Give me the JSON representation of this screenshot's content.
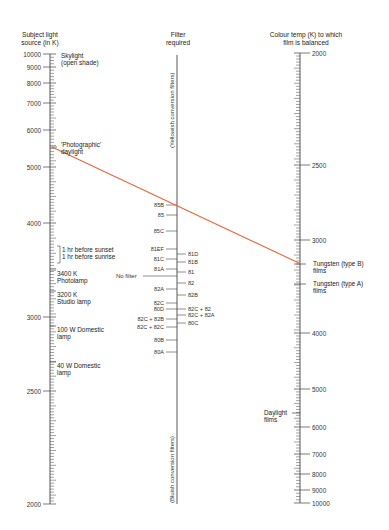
{
  "headers": {
    "left": [
      "Subject light",
      "source (in K)"
    ],
    "middle": [
      "Filter",
      "required"
    ],
    "right": [
      "Colour temp (K) to which",
      "film is balanced"
    ]
  },
  "left_axis": {
    "ticks": [
      {
        "label": "10000",
        "y": 54
      },
      {
        "label": "9000",
        "y": 67
      },
      {
        "label": "8000",
        "y": 83
      },
      {
        "label": "7000",
        "y": 103
      },
      {
        "label": "6000",
        "y": 130
      },
      {
        "label": "5000",
        "y": 167
      },
      {
        "label": "4000",
        "y": 223
      },
      {
        "label": "3000",
        "y": 317
      },
      {
        "label": "2500",
        "y": 391
      },
      {
        "label": "2000",
        "y": 504
      }
    ],
    "notes": {
      "skylight": [
        "Skylight",
        "(open shade)"
      ],
      "photographic": [
        "'Photographic'",
        "daylight"
      ],
      "sunset": [
        "1 hr before sunset",
        "1 hr before sunrise"
      ],
      "photolamp": [
        "3400 K",
        "Photolamp"
      ],
      "studio": [
        "3200 K",
        "Studio lamp"
      ],
      "domestic100": [
        "100 W Domestic",
        "lamp"
      ],
      "domestic40": [
        "40 W Domestic",
        "lamp"
      ]
    }
  },
  "middle_axis": {
    "top_note": "(Yellowish conversion filters)",
    "bottom_note": "(Bluish conversion filters)",
    "no_filter": "No filter",
    "left_filters": [
      {
        "label": "85B",
        "y": 205
      },
      {
        "label": "85",
        "y": 215
      },
      {
        "label": "85C",
        "y": 231
      },
      {
        "label": "81EF",
        "y": 249
      },
      {
        "label": "81C",
        "y": 259
      },
      {
        "label": "81A",
        "y": 269
      },
      {
        "label": "82A",
        "y": 289
      },
      {
        "label": "82C",
        "y": 303
      },
      {
        "label": "80D",
        "y": 309
      },
      {
        "label": "82C + 82B",
        "y": 319
      },
      {
        "label": "82C + 82C",
        "y": 327
      },
      {
        "label": "80B",
        "y": 340
      },
      {
        "label": "80A",
        "y": 352
      }
    ],
    "right_filters": [
      {
        "label": "81D",
        "y": 254
      },
      {
        "label": "81B",
        "y": 262
      },
      {
        "label": "81",
        "y": 272
      },
      {
        "label": "82",
        "y": 283
      },
      {
        "label": "82B",
        "y": 295
      },
      {
        "label": "82C + 82",
        "y": 309
      },
      {
        "label": "82C + 82A",
        "y": 315
      },
      {
        "label": "80C",
        "y": 323
      }
    ]
  },
  "right_axis": {
    "ticks": [
      {
        "label": "2000",
        "y": 53
      },
      {
        "label": "2500",
        "y": 165
      },
      {
        "label": "3000",
        "y": 240
      },
      {
        "label": "4000",
        "y": 333
      },
      {
        "label": "5000",
        "y": 389
      },
      {
        "label": "6000",
        "y": 427
      },
      {
        "label": "7000",
        "y": 454
      },
      {
        "label": "8000",
        "y": 474
      },
      {
        "label": "9000",
        "y": 490
      },
      {
        "label": "10000",
        "y": 503
      }
    ],
    "notes": {
      "tungsten_b": [
        "Tungsten (type B)",
        "films"
      ],
      "tungsten_a": [
        "Tungsten (type A)",
        "films"
      ],
      "daylight": [
        "Daylight",
        "films"
      ]
    }
  },
  "connector": {
    "color": "#e8663a",
    "from": "'Photographic' daylight (~5500 K)",
    "through": "85B",
    "to": "Tungsten (type B) films (~3200 K)"
  }
}
